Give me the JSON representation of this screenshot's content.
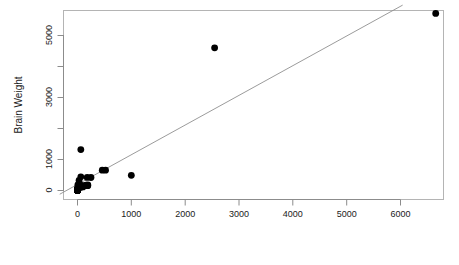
{
  "chart_data": {
    "type": "scatter",
    "title": "",
    "subtitle": "",
    "xlabel": "Body Weight",
    "ylabel": "Brain Weight",
    "xlim": [
      -330,
      7000
    ],
    "ylim": [
      -210,
      6050
    ],
    "xticks": [
      0,
      1000,
      2000,
      3000,
      4000,
      5000,
      6000
    ],
    "xticklabels": [
      "0",
      "1000",
      "2000",
      "3000",
      "4000",
      "5000",
      "6000"
    ],
    "yticks": [
      0,
      1000,
      2000,
      3000,
      4000,
      5000
    ],
    "yticklabels": [
      "0",
      "1000",
      "",
      "3000",
      "",
      "5000"
    ],
    "grid": false,
    "legend": null,
    "box": "full",
    "marker": {
      "shape": "circle",
      "color": "#000000",
      "size": 4.2
    },
    "fit_line": {
      "type": "linear-regression",
      "color": "#909090",
      "width": 0.9,
      "x": [
        -330,
        6040
      ],
      "y": [
        -120,
        5980
      ]
    },
    "series": [
      {
        "name": "Mammals",
        "x": [
          6654,
          2547,
          2,
          0.02,
          1,
          0.4,
          0.25,
          521,
          10,
          3.3,
          192,
          3,
          160,
          3,
          0.9,
          1.6,
          0.1,
          4,
          0.06,
          6.6,
          4.2,
          0.8,
          0.05,
          0.01,
          62,
          1000,
          0.12,
          2.5,
          56,
          0.03,
          0.33,
          191,
          62,
          28,
          4,
          180,
          0.9,
          0.8,
          55,
          0.2,
          0.005,
          0.01,
          0.6,
          3.4,
          15,
          9.8,
          1.7,
          3,
          29,
          0.1,
          0.12,
          120,
          50,
          0.02,
          250,
          0.05,
          460,
          100,
          0.1,
          0.9,
          0.05,
          11
        ],
        "y": [
          5712,
          4603,
          12.1,
          0.4,
          6.6,
          0.5,
          12.1,
          655.0,
          115,
          25.6,
          180,
          25,
          169,
          2.4,
          2.6,
          11.4,
          2.5,
          50.4,
          1.0,
          179,
          56,
          17.5,
          0.14,
          0.25,
          1320,
          490,
          1.0,
          12.5,
          175,
          0.33,
          3.0,
          157,
          440,
          179,
          60,
          423,
          4.8,
          20,
          98,
          5.0,
          0.14,
          0.25,
          1.9,
          44.5,
          98,
          65,
          13.5,
          25,
          325,
          4.0,
          1.0,
          157,
          165,
          0.4,
          419,
          0.75,
          655,
          115,
          2.5,
          6.4,
          1.2,
          90
        ]
      }
    ],
    "notable_points": [
      {
        "label": "african-elephant",
        "x": 6654,
        "y": 5712
      },
      {
        "label": "asian-elephant",
        "x": 2547,
        "y": 4603
      },
      {
        "label": "human",
        "x": 62,
        "y": 1320
      },
      {
        "label": "giraffe",
        "x": 529,
        "y": 680
      },
      {
        "label": "horse",
        "x": 521,
        "y": 655
      },
      {
        "label": "cow",
        "x": 465,
        "y": 423
      }
    ]
  },
  "axes": {
    "x_title": "Body Weight",
    "y_title": "Brain Weight"
  }
}
